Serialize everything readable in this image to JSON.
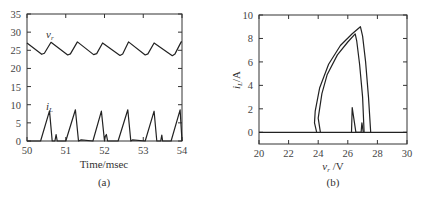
{
  "chart_data": [
    {
      "type": "line",
      "panel_label": "(a)",
      "xlabel": "Time/msec",
      "ylabel": "",
      "xlim": [
        50,
        54
      ],
      "ylim": [
        0,
        35
      ],
      "xticks": [
        "50",
        "51",
        "52",
        "53",
        "54"
      ],
      "yticks": [
        "0",
        "5",
        "10",
        "15",
        "20",
        "25",
        "30",
        "35"
      ],
      "grid": false,
      "annotations": [
        "v_r",
        "i_L"
      ],
      "series": [
        {
          "name": "v_r",
          "x": [
            50.0,
            50.38,
            50.45,
            50.62,
            51.05,
            51.12,
            51.3,
            51.72,
            51.8,
            51.95,
            52.4,
            52.47,
            52.62,
            53.05,
            53.12,
            53.28,
            53.75,
            53.82,
            53.98,
            54.0
          ],
          "y": [
            27.0,
            23.9,
            24.2,
            27.2,
            23.7,
            24.0,
            27.3,
            23.8,
            24.1,
            27.0,
            23.6,
            24.0,
            27.3,
            23.7,
            24.0,
            27.0,
            23.5,
            24.0,
            27.3,
            27.3
          ]
        },
        {
          "name": "i_L",
          "x": [
            50.0,
            50.35,
            50.58,
            50.65,
            50.72,
            50.75,
            50.78,
            51.0,
            51.25,
            51.33,
            51.4,
            51.7,
            51.92,
            52.0,
            52.02,
            52.05,
            52.08,
            52.35,
            52.6,
            52.68,
            52.72,
            53.05,
            53.28,
            53.35,
            53.45,
            53.48,
            53.5,
            53.72,
            53.95,
            54.0
          ],
          "y": [
            0,
            0,
            8.3,
            0,
            0,
            1.8,
            0,
            0,
            8.6,
            0,
            0.3,
            0,
            8.2,
            0,
            1.3,
            1.8,
            0,
            0,
            8.6,
            0,
            0.3,
            0,
            8.2,
            0,
            0,
            1.6,
            0,
            0,
            8.6,
            0
          ]
        }
      ]
    },
    {
      "type": "line",
      "panel_label": "(b)",
      "xlabel": "v_r /V",
      "ylabel": "i_L/A",
      "xlim": [
        20,
        30
      ],
      "ylim": [
        -1,
        10
      ],
      "xticks": [
        "20",
        "22",
        "24",
        "26",
        "28",
        "30"
      ],
      "yticks": [
        "0",
        "2",
        "4",
        "6",
        "8",
        "10"
      ],
      "grid": false,
      "series": [
        {
          "name": "outer_loop",
          "x": [
            27.55,
            27.4,
            27.2,
            27.0,
            26.85,
            26.3,
            25.5,
            24.7,
            24.1,
            23.8,
            23.75,
            23.9
          ],
          "y": [
            0,
            3.0,
            6.0,
            8.2,
            9.0,
            8.4,
            7.4,
            5.8,
            3.8,
            1.8,
            0.8,
            0
          ]
        },
        {
          "name": "inner_loop",
          "x": [
            27.1,
            27.0,
            26.8,
            26.6,
            26.5,
            26.0,
            25.3,
            24.6,
            24.25,
            24.0,
            24.15
          ],
          "y": [
            0,
            3.0,
            5.8,
            7.8,
            8.4,
            7.7,
            6.6,
            4.9,
            3.3,
            1.2,
            0
          ]
        },
        {
          "name": "spikes",
          "x": [
            26.25,
            26.3,
            26.55,
            26.9,
            26.95,
            27.05
          ],
          "y": [
            0,
            2.1,
            0,
            0,
            0.8,
            0
          ]
        },
        {
          "name": "zero_line",
          "x": [
            20,
            30
          ],
          "y": [
            0,
            0
          ]
        }
      ]
    }
  ],
  "panels": {
    "a": {
      "label": "(a)",
      "xlabel": "Time/msec",
      "vr_label": "v",
      "vr_sub": "r",
      "il_label": "i",
      "il_sub": "L"
    },
    "b": {
      "label": "(b)",
      "xlabel_main": "v",
      "xlabel_sub": "r",
      "xlabel_unit": " /V",
      "ylabel_main": "i",
      "ylabel_sub": "L",
      "ylabel_unit": "/A"
    }
  }
}
